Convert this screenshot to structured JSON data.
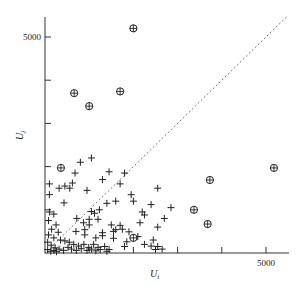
{
  "chart_data": {
    "type": "scatter",
    "title": "",
    "xlabel": "U_i",
    "ylabel": "U_j",
    "xlabel_main": "U",
    "xlabel_sub": "i",
    "ylabel_main": "U",
    "ylabel_sub": "j",
    "xlim": [
      0,
      5500
    ],
    "ylim": [
      0,
      5500
    ],
    "xticks": [
      1000,
      2000,
      3000,
      4000,
      5000
    ],
    "yticks": [
      1000,
      2000,
      3000,
      4000,
      5000
    ],
    "xtick_labels": [
      "",
      "",
      "",
      "",
      "5000"
    ],
    "ytick_labels": [
      "",
      "",
      "",
      "",
      "5000"
    ],
    "grid": false,
    "reference_line": {
      "style": "dotted",
      "equation": "y = x",
      "from": [
        0,
        0
      ],
      "to": [
        5500,
        5500
      ]
    },
    "series": [
      {
        "name": "circled",
        "marker": "circle-plus",
        "points": [
          [
            2000,
            5200
          ],
          [
            660,
            3700
          ],
          [
            1000,
            3400
          ],
          [
            1700,
            3740
          ],
          [
            360,
            1970
          ],
          [
            5180,
            1970
          ],
          [
            3730,
            1690
          ],
          [
            3370,
            1000
          ],
          [
            3680,
            670
          ],
          [
            2000,
            350
          ]
        ]
      },
      {
        "name": "plus",
        "marker": "plus",
        "points": [
          [
            1050,
            2200
          ],
          [
            800,
            2100
          ],
          [
            680,
            1850
          ],
          [
            100,
            1600
          ],
          [
            450,
            1550
          ],
          [
            620,
            1620
          ],
          [
            950,
            1450
          ],
          [
            100,
            1350
          ],
          [
            320,
            1500
          ],
          [
            560,
            1500
          ],
          [
            430,
            1160
          ],
          [
            1950,
            1350
          ],
          [
            2000,
            1200
          ],
          [
            1300,
            1700
          ],
          [
            1450,
            1880
          ],
          [
            1800,
            1850
          ],
          [
            1700,
            1600
          ],
          [
            1400,
            1150
          ],
          [
            1600,
            1200
          ],
          [
            1230,
            1000
          ],
          [
            1120,
            920
          ],
          [
            1050,
            960
          ],
          [
            2400,
            1120
          ],
          [
            2550,
            1500
          ],
          [
            2700,
            800
          ],
          [
            2200,
            950
          ],
          [
            2250,
            880
          ],
          [
            2150,
            700
          ],
          [
            2550,
            600
          ],
          [
            2850,
            1050
          ],
          [
            720,
            800
          ],
          [
            870,
            700
          ],
          [
            1000,
            650
          ],
          [
            1600,
            540
          ],
          [
            1750,
            550
          ],
          [
            1900,
            490
          ],
          [
            1550,
            500
          ],
          [
            2000,
            350
          ],
          [
            2100,
            380
          ],
          [
            1300,
            470
          ],
          [
            700,
            500
          ],
          [
            900,
            420
          ],
          [
            1150,
            350
          ],
          [
            1550,
            340
          ],
          [
            1850,
            260
          ],
          [
            2450,
            300
          ],
          [
            2250,
            200
          ],
          [
            2400,
            160
          ],
          [
            2550,
            150
          ],
          [
            1800,
            150
          ],
          [
            2500,
            80
          ],
          [
            2650,
            90
          ],
          [
            100,
            950
          ],
          [
            200,
            900
          ],
          [
            80,
            750
          ],
          [
            250,
            650
          ],
          [
            150,
            550
          ],
          [
            300,
            480
          ],
          [
            80,
            420
          ],
          [
            200,
            350
          ],
          [
            350,
            300
          ],
          [
            450,
            280
          ],
          [
            550,
            250
          ],
          [
            650,
            200
          ],
          [
            760,
            160
          ],
          [
            880,
            200
          ],
          [
            990,
            130
          ],
          [
            1100,
            200
          ],
          [
            1200,
            130
          ],
          [
            1350,
            150
          ],
          [
            1450,
            80
          ],
          [
            60,
            250
          ],
          [
            140,
            180
          ],
          [
            230,
            120
          ],
          [
            320,
            90
          ],
          [
            420,
            60
          ],
          [
            520,
            130
          ],
          [
            600,
            90
          ],
          [
            710,
            60
          ],
          [
            820,
            100
          ],
          [
            950,
            60
          ],
          [
            1050,
            90
          ],
          [
            1150,
            50
          ],
          [
            1250,
            80
          ],
          [
            1400,
            40
          ],
          [
            60,
            80
          ],
          [
            130,
            40
          ],
          [
            200,
            60
          ],
          [
            260,
            30
          ],
          [
            1300,
            400
          ],
          [
            900,
            540
          ],
          [
            1500,
            650
          ],
          [
            1200,
            780
          ],
          [
            1000,
            780
          ],
          [
            1700,
            640
          ]
        ]
      }
    ],
    "legend": null
  }
}
